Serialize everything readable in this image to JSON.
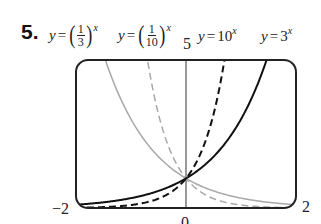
{
  "problem": {
    "number": "5."
  },
  "equations": [
    {
      "lhs": "y",
      "base_num": "1",
      "base_den": "3",
      "exp": "x"
    },
    {
      "lhs": "y",
      "base_num": "1",
      "base_den": "10",
      "exp": "x"
    },
    {
      "lhs": "y",
      "base": "10",
      "exp": "x"
    },
    {
      "lhs": "y",
      "base": "3",
      "exp": "x"
    }
  ],
  "axis_labels": {
    "ymax": "5",
    "xmin": "−2",
    "xmax": "2",
    "ymin": "0"
  },
  "chart_data": {
    "type": "line",
    "title": "",
    "xlabel": "",
    "ylabel": "",
    "xlim": [
      -2,
      2
    ],
    "ylim": [
      0,
      5
    ],
    "grid": false,
    "legend": "equation labels above plot, left to right",
    "tick_labels": {
      "x": [
        "-2",
        "2"
      ],
      "y": [
        "0",
        "5"
      ]
    },
    "series": [
      {
        "name": "y = (1/3)^x",
        "style": "solid gray",
        "x": [
          -2,
          -1.465,
          -1,
          0,
          1,
          2
        ],
        "y": [
          9,
          5,
          3,
          1,
          0.333,
          0.111
        ]
      },
      {
        "name": "y = (1/10)^x",
        "style": "dashed gray",
        "x": [
          -2,
          -0.699,
          -0.5,
          0,
          0.5,
          1,
          2
        ],
        "y": [
          100,
          5,
          3.162,
          1,
          0.316,
          0.1,
          0.01
        ]
      },
      {
        "name": "y = 10^x",
        "style": "dashed black",
        "x": [
          -2,
          -1,
          -0.5,
          0,
          0.5,
          0.699
        ],
        "y": [
          0.01,
          0.1,
          0.316,
          1,
          3.162,
          5
        ]
      },
      {
        "name": "y = 3^x",
        "style": "solid black",
        "x": [
          -2,
          -1,
          0,
          1,
          1.465
        ],
        "y": [
          0.111,
          0.333,
          1,
          3,
          5
        ]
      }
    ],
    "intersection": {
      "x": 0,
      "y": 1
    }
  },
  "colors": {
    "dark_curve": "#111111",
    "light_curve": "#a8a8a8",
    "frame": "#222222"
  }
}
